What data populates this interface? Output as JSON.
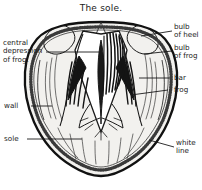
{
  "figure": {
    "title": "The sole.",
    "background_color": "#ffffff",
    "ink_color": "#1a1a1a",
    "horn_fill_color": "#f2f1ee"
  },
  "labels": {
    "central_depression_of_frog": "central\ndepression\nof frog.",
    "wall": "wall",
    "sole": "sole",
    "bulb_of_heel": "bulb\nof heel",
    "bulb_of_frog": "bulb\nof frog",
    "bar": "bar",
    "frog": "frog",
    "white_line": "white\nline"
  }
}
